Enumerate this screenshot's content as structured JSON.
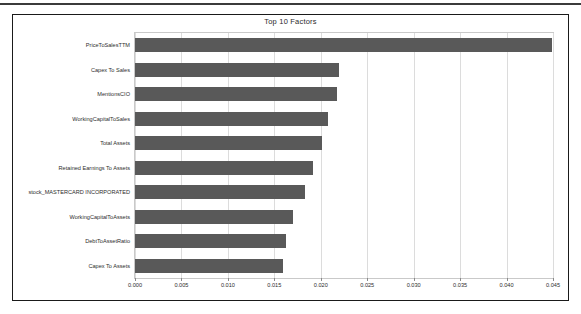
{
  "figure": {
    "title": "Top 10 Factors"
  },
  "chart_data": {
    "type": "bar",
    "orientation": "horizontal",
    "title": "Top 10 Factors",
    "xlabel": "",
    "ylabel": "",
    "xlim": [
      0.0,
      0.045
    ],
    "grid": true,
    "legend": null,
    "bar_color": "#595959",
    "categories": [
      "PriceToSalesTTM",
      "Capex To Sales",
      "MentionsCIO",
      "WorkingCapitalToSales",
      "Total Assets",
      "Retained Earnings To Assets",
      "stock_MASTERCARD INCORPORATED",
      "WorkingCapitalToAssets",
      "DebtToAssetRatio",
      "Capex To Assets"
    ],
    "values": [
      0.0449,
      0.022,
      0.0217,
      0.0208,
      0.0201,
      0.0192,
      0.0183,
      0.017,
      0.0163,
      0.0159
    ],
    "xticks": [
      0.0,
      0.005,
      0.01,
      0.015,
      0.02,
      0.025,
      0.03,
      0.035,
      0.04,
      0.045
    ],
    "xtick_labels": [
      "0.000",
      "0.005",
      "0.010",
      "0.015",
      "0.020",
      "0.025",
      "0.030",
      "0.035",
      "0.040",
      "0.045"
    ]
  }
}
